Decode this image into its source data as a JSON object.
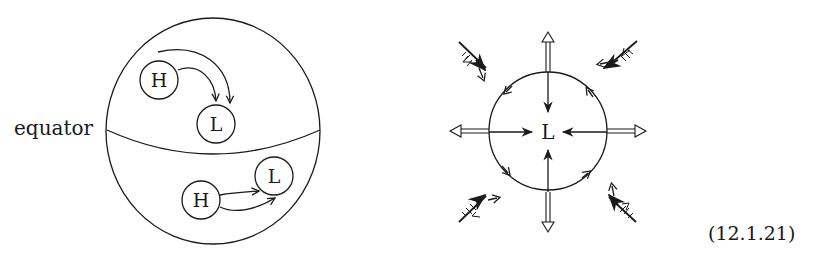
{
  "figure": {
    "left_panel": {
      "name": "globe-pressure-flow",
      "equator_label": "equator",
      "northern_hemisphere": {
        "high_label": "H",
        "low_label": "L"
      },
      "southern_hemisphere": {
        "high_label": "H",
        "low_label": "L"
      }
    },
    "right_panel": {
      "name": "low-pressure-cyclone",
      "center_label": "L"
    },
    "equation_number": "(12.1.21)"
  },
  "colors": {
    "ink": "#1a1a1a",
    "background": "#ffffff"
  }
}
